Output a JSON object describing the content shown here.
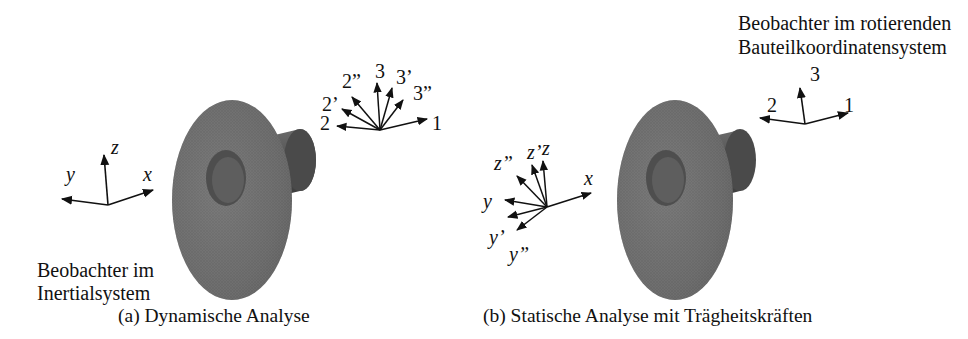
{
  "panel_a": {
    "caption": "(a) Dynamische Analyse",
    "observer_label_line1": "Beobachter im",
    "observer_label_line2": "Inertialsystem",
    "inertial_axes": {
      "z": "z",
      "y": "y",
      "x": "x"
    },
    "rotating_axes": {
      "a2": "2",
      "a2p": "2’",
      "a2pp": "2”",
      "a3": "3",
      "a3p": "3’",
      "a3pp": "3”",
      "a1": "1"
    }
  },
  "panel_b": {
    "caption": "(b) Statische Analyse mit Trägheitskräften",
    "observer_label_line1": "Beobachter im rotierenden",
    "observer_label_line2": "Bauteilkoordinatensystem",
    "inertial_axes": {
      "x": "x",
      "z": "z",
      "zp": "z’",
      "zpp": "z”",
      "y": "y",
      "yp": "y’",
      "ypp": "y”"
    },
    "body_axes": {
      "a3": "3",
      "a2": "2",
      "a1": "1"
    }
  },
  "colors": {
    "mesh_dark": "#3a3a3a",
    "mesh_mid": "#6e6e6e",
    "mesh_light": "#8a8a8a",
    "ink": "#111111"
  }
}
